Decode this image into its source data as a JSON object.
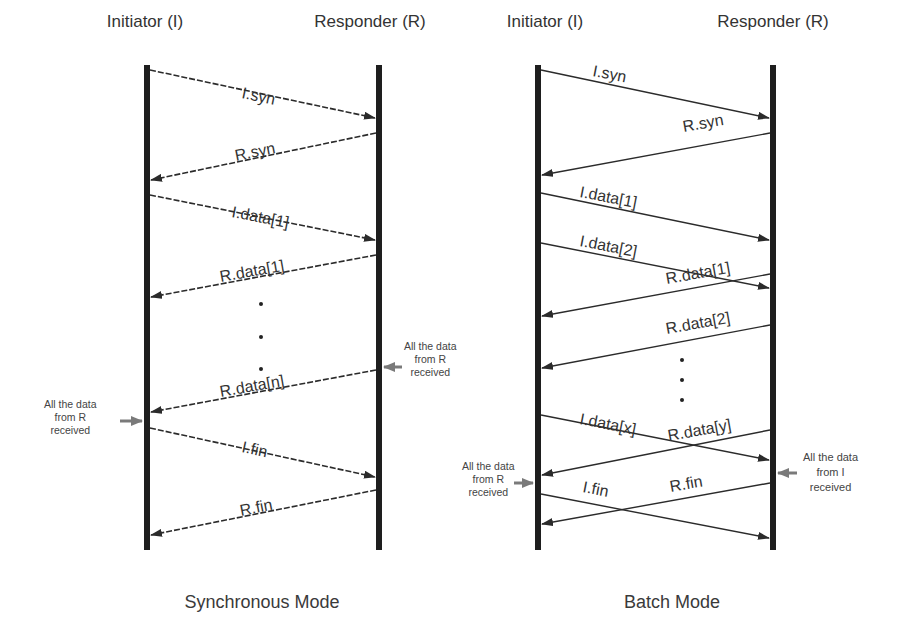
{
  "diagrams": [
    {
      "id": "synchronous",
      "title": "Synchronous Mode",
      "participants": {
        "initiator": "Initiator (I)",
        "responder": "Responder (R)"
      },
      "messages": [
        {
          "label": "I.syn",
          "from": "I",
          "to": "R"
        },
        {
          "label": "R.syn",
          "from": "R",
          "to": "I"
        },
        {
          "label": "I.data[1]",
          "from": "I",
          "to": "R"
        },
        {
          "label": "R.data[1]",
          "from": "R",
          "to": "I"
        },
        {
          "label": "R.data[n]",
          "from": "R",
          "to": "I"
        },
        {
          "label": "I.fin",
          "from": "I",
          "to": "R"
        },
        {
          "label": "R.fin",
          "from": "R",
          "to": "I"
        }
      ],
      "ellipsis": "• • •",
      "notes": [
        {
          "line1": "All the data",
          "line2": "from R",
          "line3": "received",
          "side": "responder"
        },
        {
          "line1": "All the data",
          "line2": "from R",
          "line3": "received",
          "side": "initiator"
        }
      ]
    },
    {
      "id": "batch",
      "title": "Batch Mode",
      "participants": {
        "initiator": "Initiator (I)",
        "responder": "Responder (R)"
      },
      "messages": [
        {
          "label": "I.syn",
          "from": "I",
          "to": "R"
        },
        {
          "label": "R.syn",
          "from": "R",
          "to": "I"
        },
        {
          "label": "I.data[1]",
          "from": "I",
          "to": "R"
        },
        {
          "label": "I.data[2]",
          "from": "I",
          "to": "R"
        },
        {
          "label": "R.data[1]",
          "from": "R",
          "to": "I"
        },
        {
          "label": "R.data[2]",
          "from": "R",
          "to": "I"
        },
        {
          "label": "I.data[x]",
          "from": "I",
          "to": "R"
        },
        {
          "label": "R.data[y]",
          "from": "R",
          "to": "I"
        },
        {
          "label": "I.fin",
          "from": "I",
          "to": "R"
        },
        {
          "label": "R.fin",
          "from": "R",
          "to": "I"
        }
      ],
      "ellipsis": "• • •",
      "notes": [
        {
          "line1": "All the data",
          "line2": "from R",
          "line3": "received",
          "side": "initiator"
        },
        {
          "line1": "All the data",
          "line2": "from I",
          "line3": "received",
          "side": "responder"
        }
      ]
    }
  ],
  "colors": {
    "lifeline": "#1e1e1e",
    "arrow": "#2b2b2b",
    "note_arrow": "#777777",
    "text": "#333333"
  }
}
